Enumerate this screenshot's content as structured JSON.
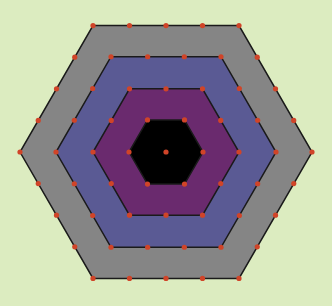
{
  "canvas": {
    "width": 332,
    "height": 306,
    "background": "#dcecc0"
  },
  "figure": {
    "type": "concentric-hexagons",
    "center": [
      166,
      152
    ],
    "rings": [
      {
        "name": "outer-ring",
        "radius": 146,
        "fill": "#858585",
        "edge_divisions": 4
      },
      {
        "name": "second-ring",
        "radius": 110,
        "fill": "#5a5a94",
        "edge_divisions": 3
      },
      {
        "name": "third-ring",
        "radius": 73,
        "fill": "#6a2a6e",
        "edge_divisions": 2
      },
      {
        "name": "core-hexagon",
        "radius": 37,
        "fill": "#000000",
        "edge_divisions": 1
      }
    ],
    "stroke": "#1a1a1a",
    "stroke_width": 1.5,
    "dot_color": "#d04428",
    "dot_radius": 2.6,
    "center_dot": true
  }
}
